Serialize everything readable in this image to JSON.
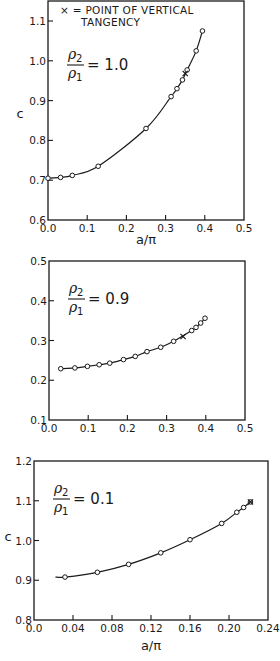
{
  "chart_data": [
    {
      "type": "line",
      "title": "",
      "panel_label": "ρ2/ρ1 = 1.0",
      "ratio_value": "1.0",
      "annotation": [
        "× = POINT OF VERTICAL",
        "TANGENCY"
      ],
      "xlabel": "a/π",
      "ylabel": "c",
      "xlim": [
        0.0,
        0.5
      ],
      "ylim": [
        0.6,
        1.1
      ],
      "xticks": [
        0.0,
        0.1,
        0.2,
        0.3,
        0.4,
        0.5
      ],
      "xtick_labels": [
        "0.0",
        "0.1",
        "0.2",
        "0.3",
        "0.4",
        "0.5"
      ],
      "yticks": [
        0.6,
        0.7,
        0.8,
        0.9,
        1.0,
        1.1
      ],
      "ytick_labels": [
        "0.6",
        "0.7",
        "0.8",
        "0.9",
        "1.0",
        "1.1"
      ],
      "grid": false,
      "series": [
        {
          "name": "computed points",
          "marker": "open-circle",
          "x": [
            0.0,
            0.032,
            0.062,
            0.128,
            0.25,
            0.314,
            0.329,
            0.343,
            0.355,
            0.378,
            0.394
          ],
          "y": [
            0.705,
            0.707,
            0.712,
            0.735,
            0.83,
            0.91,
            0.93,
            0.952,
            0.977,
            1.025,
            1.075
          ]
        }
      ],
      "vertical_tangency_point": {
        "x": 0.35,
        "y": 0.968
      },
      "curve_start_x": 0.0
    },
    {
      "type": "line",
      "title": "",
      "panel_label": "ρ2/ρ1 = 0.9",
      "ratio_value": "0.9",
      "xlabel": "",
      "ylabel": "",
      "xlim": [
        0.0,
        0.5
      ],
      "ylim": [
        0.1,
        0.5
      ],
      "xticks": [
        0.0,
        0.1,
        0.2,
        0.3,
        0.4,
        0.5
      ],
      "xtick_labels": [
        "0.0",
        "0.1",
        "0.2",
        "0.3",
        "0.4",
        "0.5"
      ],
      "yticks": [
        0.1,
        0.2,
        0.3,
        0.4,
        0.5
      ],
      "ytick_labels": [
        "0.1",
        "0.2",
        "0.3",
        "0.4",
        "0.5"
      ],
      "grid": false,
      "series": [
        {
          "name": "computed points",
          "marker": "open-circle",
          "x": [
            0.03,
            0.066,
            0.098,
            0.128,
            0.155,
            0.19,
            0.22,
            0.25,
            0.285,
            0.318,
            0.364,
            0.375,
            0.387,
            0.398
          ],
          "y": [
            0.229,
            0.231,
            0.235,
            0.239,
            0.243,
            0.252,
            0.26,
            0.272,
            0.283,
            0.298,
            0.325,
            0.333,
            0.344,
            0.356
          ]
        }
      ],
      "vertical_tangency_point": {
        "x": 0.342,
        "y": 0.31
      },
      "curve_start_x": 0.03
    },
    {
      "type": "line",
      "title": "",
      "panel_label": "ρ2/ρ1 = 0.1",
      "ratio_value": "0.1",
      "xlabel": "a/π",
      "ylabel": "c",
      "xlim": [
        0.0,
        0.24
      ],
      "ylim": [
        0.8,
        1.2
      ],
      "xticks": [
        0.0,
        0.04,
        0.08,
        0.12,
        0.16,
        0.2,
        0.24
      ],
      "xtick_labels": [
        "0.0",
        "0.04",
        "0.08",
        "0.12",
        "0.16",
        "0.20",
        "0.24"
      ],
      "yticks": [
        0.8,
        0.9,
        1.0,
        1.1,
        1.2
      ],
      "ytick_labels": [
        "0.8",
        "0.9",
        "1.0",
        "1.1",
        "1.2"
      ],
      "grid": false,
      "series": [
        {
          "name": "computed points",
          "marker": "open-circle",
          "x": [
            0.0318,
            0.065,
            0.097,
            0.13,
            0.16,
            0.1925,
            0.208,
            0.215,
            0.222
          ],
          "y": [
            0.908,
            0.92,
            0.94,
            0.969,
            1.002,
            1.043,
            1.071,
            1.083,
            1.097
          ]
        }
      ],
      "vertical_tangency_point": {
        "x": 0.222,
        "y": 1.097
      },
      "curve_start_x": 0.022,
      "curve_start_y": 0.908
    }
  ],
  "layout": {
    "panels": [
      {
        "left": 48,
        "right": 244,
        "top": 1,
        "bottom": 220,
        "ylabel_pos": [
          20,
          118
        ],
        "xlabel_pos": [
          146,
          244
        ],
        "ytick_top_value": 1.1,
        "ytick_top_px": 21
      },
      {
        "left": 49,
        "right": 245,
        "top": 261,
        "bottom": 420,
        "ylabel_pos": null,
        "xlabel_pos": [
          147,
          447
        ]
      },
      {
        "left": 34,
        "right": 268,
        "top": 461,
        "bottom": 620,
        "ylabel_pos": [
          8,
          541
        ],
        "xlabel_pos": [
          151,
          650
        ]
      }
    ]
  }
}
